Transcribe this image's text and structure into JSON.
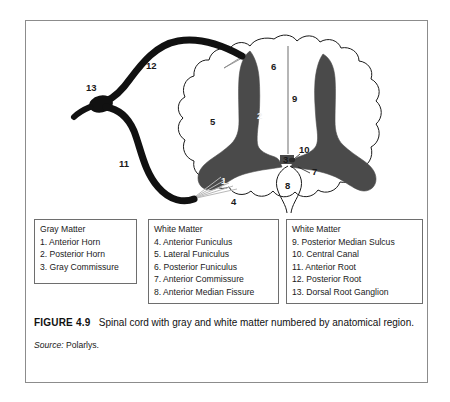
{
  "figure": {
    "caption_label": "FIGURE 4.9",
    "caption_text": "Spinal cord with gray and white matter numbered by anatomical region.",
    "source_label": "Source:",
    "source_value": "Polarlys."
  },
  "colors": {
    "gray_matter": "#4a4a4a",
    "white_matter": "#ffffff",
    "outline": "#1a1a1a",
    "nerve_root": "#111111",
    "frame": "#8c8c8c",
    "legend_border": "#6e6e6e",
    "text": "#1a1a1a"
  },
  "diagram": {
    "labels": [
      {
        "id": "label-1",
        "text": "1",
        "x": 195,
        "y": 155,
        "on_gray": true
      },
      {
        "id": "label-2",
        "text": "2",
        "x": 231,
        "y": 90,
        "on_gray": true
      },
      {
        "id": "label-3",
        "text": "3",
        "x": 257,
        "y": 143,
        "on_gray": false
      },
      {
        "id": "label-4",
        "text": "4",
        "x": 205,
        "y": 199,
        "on_gray": false
      },
      {
        "id": "label-5",
        "text": "5",
        "x": 184,
        "y": 122,
        "on_gray": false
      },
      {
        "id": "label-6",
        "text": "6",
        "x": 245,
        "y": 66,
        "on_gray": false
      },
      {
        "id": "label-7",
        "text": "7",
        "x": 285,
        "y": 153,
        "on_gray": false
      },
      {
        "id": "label-8",
        "text": "8",
        "x": 271,
        "y": 168,
        "on_gray": false
      },
      {
        "id": "label-9",
        "text": "9",
        "x": 267,
        "y": 94,
        "on_gray": false
      },
      {
        "id": "label-10",
        "text": "10",
        "x": 277,
        "y": 129,
        "on_gray": false
      },
      {
        "id": "label-11",
        "text": "11",
        "x": 118,
        "y": 161,
        "on_gray": false
      },
      {
        "id": "label-12",
        "text": "12",
        "x": 120,
        "y": 65,
        "on_gray": false
      },
      {
        "id": "label-13",
        "text": "13",
        "x": 85,
        "y": 97,
        "on_gray": false
      }
    ]
  },
  "legend": {
    "box1": {
      "title": "Gray Matter",
      "items": [
        "1. Anterior Horn",
        "2. Posterior Horn",
        "3. Gray Commissure"
      ]
    },
    "box2": {
      "title": "White Matter",
      "items": [
        "4. Anterior Funiculus",
        "5. Lateral Funiculus",
        "6. Posterior Funiculus",
        "7. Anterior Commissure",
        "8. Anterior Median Fissure"
      ]
    },
    "box3": {
      "title": "White Matter",
      "items": [
        "9. Posterior Median Sulcus",
        "10. Central Canal",
        "11. Anterior Root",
        "12. Posterior Root",
        "13. Dorsal Root Ganglion"
      ]
    }
  }
}
